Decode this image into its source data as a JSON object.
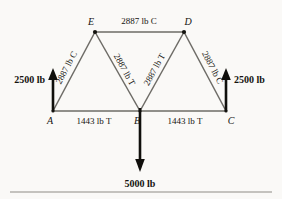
{
  "diagram": {
    "background_color": "#faf9f7",
    "member_color": "#6d6b66",
    "text_color": "#14130f",
    "arrow_color": "#100f0c",
    "joints": [
      {
        "id": "A",
        "label": "A",
        "x": 53,
        "y": 111
      },
      {
        "id": "B",
        "label": "B",
        "x": 140,
        "y": 111
      },
      {
        "id": "C",
        "label": "C",
        "x": 226,
        "y": 111
      },
      {
        "id": "D",
        "label": "D",
        "x": 184,
        "y": 32
      },
      {
        "id": "E",
        "label": "E",
        "x": 95,
        "y": 32
      }
    ],
    "members": [
      {
        "id": "ED",
        "from": "E",
        "to": "D",
        "label": "2887 lb C",
        "magnitude": 2887,
        "unit": "lb",
        "state": "C"
      },
      {
        "id": "AE",
        "from": "A",
        "to": "E",
        "label": "2887 lb C",
        "magnitude": 2887,
        "unit": "lb",
        "state": "C"
      },
      {
        "id": "EB",
        "from": "E",
        "to": "B",
        "label": "2887 lb T",
        "magnitude": 2887,
        "unit": "lb",
        "state": "T"
      },
      {
        "id": "BD",
        "from": "B",
        "to": "D",
        "label": "2887 lb T",
        "magnitude": 2887,
        "unit": "lb",
        "state": "T"
      },
      {
        "id": "DC",
        "from": "D",
        "to": "C",
        "label": "2887 lb C",
        "magnitude": 2887,
        "unit": "lb",
        "state": "C"
      },
      {
        "id": "AB",
        "from": "A",
        "to": "B",
        "label": "1443 lb T",
        "magnitude": 1443,
        "unit": "lb",
        "state": "T"
      },
      {
        "id": "BC",
        "from": "B",
        "to": "C",
        "label": "1443 lb T",
        "magnitude": 1443,
        "unit": "lb",
        "state": "T"
      }
    ],
    "forces": [
      {
        "id": "reaction-a",
        "label": "2500 lb",
        "magnitude": 2500,
        "unit": "lb",
        "direction": "up",
        "at_joint": "A"
      },
      {
        "id": "reaction-c",
        "label": "2500 lb",
        "magnitude": 2500,
        "unit": "lb",
        "direction": "up",
        "at_joint": "C"
      },
      {
        "id": "load-b",
        "label": "5000 lb",
        "magnitude": 5000,
        "unit": "lb",
        "direction": "down",
        "at_joint": "B"
      }
    ]
  }
}
